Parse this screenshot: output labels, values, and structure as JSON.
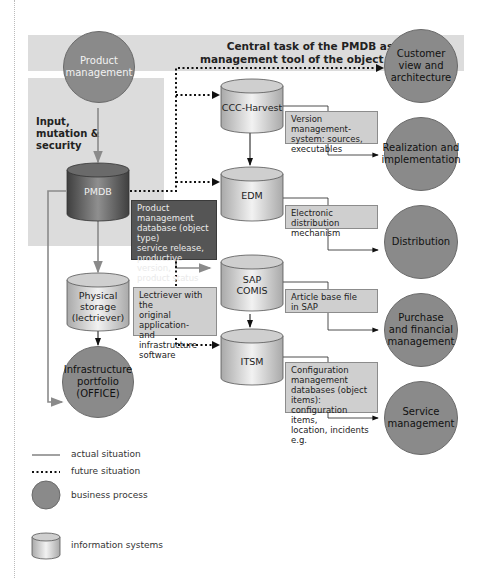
{
  "title": "Central task of the PMDB as management tool of the object types",
  "title_lines": [
    "Central task of the PMDB as",
    "management tool of the object types"
  ],
  "input_label_lines": [
    "Input,",
    "mutation &",
    "security"
  ],
  "business_processes": {
    "product_management": [
      "Product",
      "management"
    ],
    "customer_view": [
      "Customer",
      "view and",
      "architecture"
    ],
    "realization": [
      "Realization and",
      "implementation"
    ],
    "distribution": [
      "Distribution"
    ],
    "purchase": [
      "Purchase",
      "and financial",
      "management"
    ],
    "service": [
      "Service",
      "management"
    ],
    "infrastructure": [
      "Infrastructure",
      "portfolio",
      "(OFFICE)"
    ]
  },
  "information_systems": {
    "pmdb": [
      "PMDB"
    ],
    "ccc_harvest": [
      "CCC-Harvest"
    ],
    "edm": [
      "EDM"
    ],
    "sap_comis": [
      "SAP",
      "COMIS"
    ],
    "itsm": [
      "ITSM"
    ],
    "physical_storage": [
      "Physical",
      "storage",
      "(lectriever)"
    ]
  },
  "notes": {
    "pmdb": [
      "Product management",
      "database (object type)",
      "service release,",
      "productive version,",
      "product status"
    ],
    "lectriever": [
      "Lectriever with the",
      "original application-",
      "and infrastructure",
      "software"
    ],
    "ccc_harvest": [
      "Version management-",
      "system: sources,",
      "executables"
    ],
    "edm": [
      "Electronic distribution",
      "mechanism"
    ],
    "sap": [
      "Article base file",
      "in SAP"
    ],
    "itsm": [
      "Configuration",
      "management",
      "databases (object items):",
      "configuration items,",
      "location, incidents e.g."
    ]
  },
  "legend": {
    "actual": "actual situation",
    "future": "future situation",
    "business_process": "business process",
    "information_systems": "information systems"
  },
  "colors": {
    "band": "#dcdcdc",
    "circle": "#8a8a8a",
    "pmdb_dark": "#555555",
    "note": "#cfcfcf",
    "actual_line": "#8a8a8a",
    "future_line": "#111111"
  }
}
